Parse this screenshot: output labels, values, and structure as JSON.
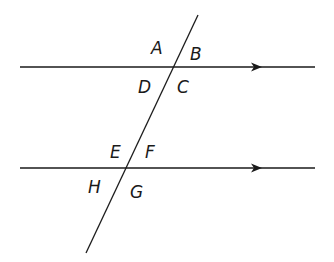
{
  "diagram": {
    "stroke_color": "#1a1a1a",
    "background": "#ffffff",
    "lines": {
      "top": {
        "x1": 20,
        "y1": 67,
        "x2": 315,
        "y2": 67,
        "arrow_x": 262
      },
      "bottom": {
        "x1": 20,
        "y1": 168,
        "x2": 315,
        "y2": 168,
        "arrow_x": 262
      },
      "transversal": {
        "x1": 198,
        "y1": 15,
        "x2": 86,
        "y2": 253
      }
    },
    "angle_labels": {
      "A": "A",
      "B": "B",
      "C": "C",
      "D": "D",
      "E": "E",
      "F": "F",
      "G": "G",
      "H": "H"
    }
  }
}
